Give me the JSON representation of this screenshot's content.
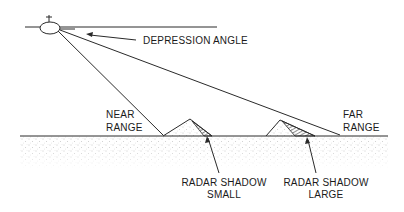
{
  "diagram": {
    "title": "",
    "labels": {
      "depression_angle": "DEPRESSION ANGLE",
      "near_range_1": "NEAR",
      "near_range_2": "RANGE",
      "far_range_1": "FAR",
      "far_range_2": "RANGE",
      "shadow_small_1": "RADAR SHADOW",
      "shadow_small_2": "SMALL",
      "shadow_large_1": "RADAR SHADOW",
      "shadow_large_2": "LARGE"
    },
    "nodes": [
      {
        "id": "aircraft",
        "type": "antenna-platform",
        "x": 50,
        "y": 28
      },
      {
        "id": "hill-small",
        "type": "terrain",
        "peak": [
          190,
          119
        ]
      },
      {
        "id": "hill-large",
        "type": "terrain",
        "peak": [
          280,
          120
        ]
      }
    ],
    "edges": [
      {
        "from": "aircraft",
        "to": "near-range",
        "label": "NEAR RANGE"
      },
      {
        "from": "aircraft",
        "to": "far-range",
        "label": "FAR RANGE"
      }
    ],
    "colors": {
      "line": "#2a2a2a",
      "ground_stipple": "#9a9a9a",
      "background": "#ffffff"
    }
  }
}
